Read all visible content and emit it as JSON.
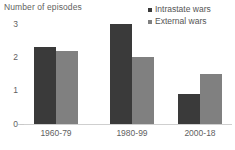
{
  "chart_data": {
    "type": "bar",
    "title": "",
    "ylabel": "Number of episodes",
    "xlabel": "",
    "categories": [
      "1960-79",
      "1980-99",
      "2000-18"
    ],
    "series": [
      {
        "name": "Intrastate wars",
        "color": "#3a3a3a",
        "values": [
          2.3,
          3.0,
          0.9
        ]
      },
      {
        "name": "External wars",
        "color": "#808080",
        "values": [
          2.2,
          2.0,
          1.5
        ]
      }
    ],
    "ylim": [
      0,
      3
    ],
    "yticks": [
      "0",
      "1",
      "2",
      "3"
    ],
    "ytick_values": [
      0,
      1,
      2,
      3
    ],
    "grid": false,
    "legend_position": "top-right"
  },
  "legend": {
    "items": [
      {
        "label": "Intrastate wars",
        "marker": "square-marker"
      },
      {
        "label": "External wars",
        "marker": "square-marker"
      }
    ]
  },
  "axes": {
    "y_title": "Number of episodes",
    "y_tick_labels": [
      "3",
      "2",
      "1",
      "0"
    ],
    "x_tick_labels": [
      "1960-79",
      "1980-99",
      "2000-18"
    ]
  },
  "colors": {
    "intrastate": "#3a3a3a",
    "external": "#808080",
    "text": "#5f5f5f",
    "axis": "#cfcfcf",
    "background": "#ffffff"
  }
}
